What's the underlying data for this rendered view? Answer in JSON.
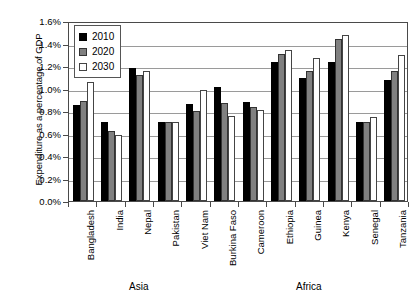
{
  "chart_data": {
    "type": "bar",
    "title": "",
    "xlabel": "",
    "ylabel": "Expenditure as a percentage of GDP",
    "ylim": [
      0,
      1.6
    ],
    "y_tick_labels": [
      "1.6%",
      "1.4%",
      "1.2%",
      "1.0%",
      "0.8%",
      "0.6%",
      "0.4%",
      "0.2%",
      "0.0%"
    ],
    "y_tick_values": [
      1.6,
      1.4,
      1.2,
      1.0,
      0.8,
      0.6,
      0.4,
      0.2,
      0.0
    ],
    "grid": true,
    "legend_position": "top-left",
    "categories": [
      "Bangladesh",
      "India",
      "Nepal",
      "Pakistan",
      "Viet Nam",
      "Burkina Faso",
      "Cameroon",
      "Ethiopia",
      "Guinea",
      "Kenya",
      "Senegal",
      "Tanzania"
    ],
    "series": [
      {
        "name": "2010",
        "color": "#000000",
        "values": [
          0.85,
          0.7,
          1.18,
          0.7,
          0.86,
          1.01,
          0.88,
          1.24,
          1.09,
          1.24,
          0.7,
          1.08
        ]
      },
      {
        "name": "2020",
        "color": "#808080",
        "values": [
          0.89,
          0.62,
          1.12,
          0.7,
          0.8,
          0.87,
          0.84,
          1.31,
          1.16,
          1.44,
          0.7,
          1.16
        ]
      },
      {
        "name": "2030",
        "color": "#ffffff",
        "values": [
          1.06,
          0.59,
          1.16,
          0.7,
          0.99,
          0.76,
          0.81,
          1.34,
          1.27,
          1.48,
          0.75,
          1.3
        ]
      }
    ],
    "groups": [
      {
        "label": "Asia",
        "categories": [
          "Bangladesh",
          "India",
          "Nepal",
          "Pakistan",
          "Viet Nam"
        ]
      },
      {
        "label": "Africa",
        "categories": [
          "Burkina Faso",
          "Cameroon",
          "Ethiopia",
          "Guinea",
          "Kenya",
          "Senegal",
          "Tanzania"
        ]
      }
    ]
  },
  "legend": {
    "entries": [
      {
        "label": "2010"
      },
      {
        "label": "2020"
      },
      {
        "label": "2030"
      }
    ]
  },
  "axes": {
    "y_title": "Expenditure as a percentage of GDP"
  },
  "regions": [
    {
      "label": "Asia"
    },
    {
      "label": "Africa"
    }
  ]
}
